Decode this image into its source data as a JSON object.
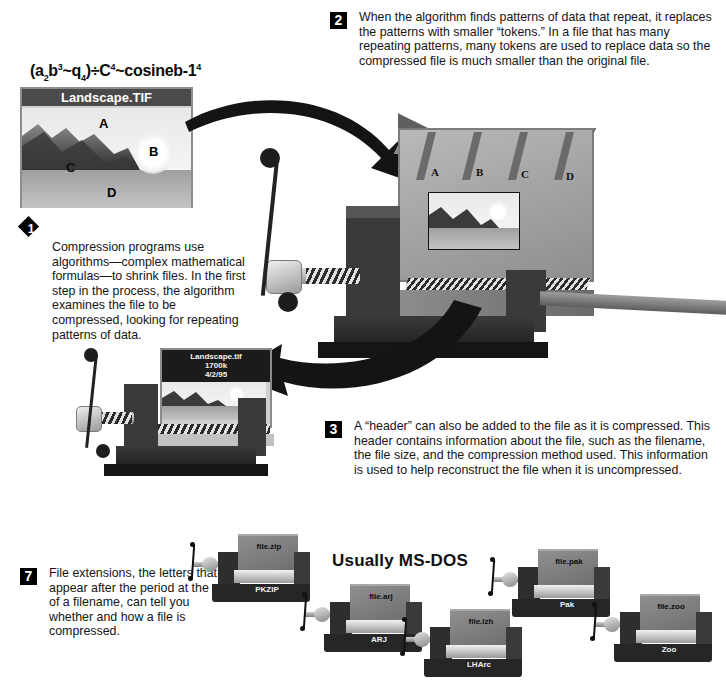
{
  "page": {
    "background": "#ffffff",
    "ink": "#111111"
  },
  "formula": {
    "text": "(a2b3~q4)÷C4~cosineb-14",
    "parts": [
      "(a",
      "2",
      "b",
      "3",
      "~q",
      "4",
      ")÷C",
      "4",
      "~cosineb-1",
      "4"
    ]
  },
  "original_file": {
    "title": "Landscape.TIF",
    "region_labels": [
      "A",
      "B",
      "C",
      "D"
    ]
  },
  "steps": [
    {
      "number": "1",
      "marker_shape": "diamond",
      "text": "Compression programs use algorithms—complex mathematical formulas—to shrink files. In the first step in the process, the algorithm examines the file to be compressed, looking for repeating patterns of data."
    },
    {
      "number": "2",
      "marker_shape": "square",
      "text": "When the algorithm finds patterns of data that repeat, it replaces the patterns with smaller “tokens.” In a file that has many repeating patterns, many tokens are used to replace data so the compressed file is much smaller than the original file."
    },
    {
      "number": "3",
      "marker_shape": "square",
      "text": "A “header” can also be added to the file as it is compressed. This header contains information about the file, such as the filename, the file size, and the compression method used. This information is used to help reconstruct the file when it is uncompressed."
    },
    {
      "number": "7",
      "marker_shape": "square",
      "text": "File extensions, the letters that appear after the period at the end of a filename, can tell you whether and how a file is compressed."
    }
  ],
  "token_vise": {
    "token_labels": [
      "A",
      "B",
      "C",
      "D"
    ]
  },
  "compressed_file": {
    "header_lines": [
      "Landscape.tif",
      "1700k",
      "4/2/95"
    ]
  },
  "extensions_section": {
    "heading": "Usually MS-DOS",
    "items": [
      {
        "filename": "file.zip",
        "method": "PKZIP"
      },
      {
        "filename": "file.arj",
        "method": "ARJ"
      },
      {
        "filename": "file.lzh",
        "method": "LHArc"
      },
      {
        "filename": "file.pak",
        "method": "Pak"
      },
      {
        "filename": "file.zoo",
        "method": "Zoo"
      }
    ]
  },
  "colors": {
    "dark": "#2e2e2e",
    "mid": "#6f6f6f",
    "light": "#9d9d9d",
    "paper": "#ffffff"
  }
}
